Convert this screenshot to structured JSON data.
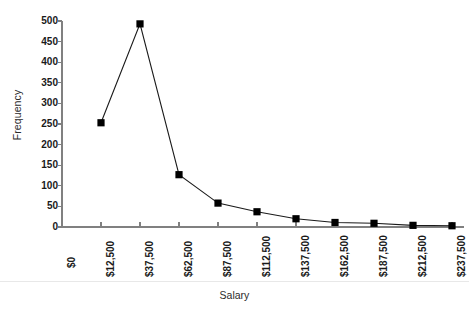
{
  "chart": {
    "ylabel": "Frequency",
    "xlabel": "Salary"
  },
  "chart_data": {
    "type": "line",
    "title": "",
    "subtitle": "",
    "xlabel": "Salary",
    "ylabel": "Frequency",
    "grid": false,
    "legend": "none",
    "marker": "square",
    "line_color": "#1a1a1a",
    "marker_color": "#000000",
    "axis_color": "#808080",
    "xlim": [
      0,
      250000
    ],
    "ylim": [
      0,
      500
    ],
    "ytick_values": [
      0,
      50,
      100,
      150,
      200,
      250,
      300,
      350,
      400,
      450,
      500
    ],
    "ytick_labels": [
      "0",
      "50",
      "100",
      "150",
      "200",
      "250",
      "300",
      "350",
      "400",
      "450",
      "500"
    ],
    "xtick_values": [
      0,
      12500,
      37500,
      62500,
      87500,
      112500,
      137500,
      162500,
      187500,
      212500,
      237500
    ],
    "xtick_labels": [
      "$0",
      "$12,500",
      "$37,500",
      "$62,500",
      "$87,500",
      "$112,500",
      "$137,500",
      "$162,500",
      "$187,500",
      "$212,500",
      "$237,500"
    ],
    "categories": [
      "$12,500",
      "$37,500",
      "$62,500",
      "$87,500",
      "$112,500",
      "$137,500",
      "$162,500",
      "$187,500",
      "$212,500",
      "$237,500"
    ],
    "x": [
      12500,
      37500,
      62500,
      87500,
      112500,
      137500,
      162500,
      187500,
      212500,
      237500
    ],
    "values": [
      253,
      493,
      127,
      58,
      37,
      20,
      11,
      9,
      4,
      3
    ],
    "series": [
      {
        "name": "Frequency",
        "values": [
          253,
          493,
          127,
          58,
          37,
          20,
          11,
          9,
          4,
          3
        ]
      }
    ]
  }
}
